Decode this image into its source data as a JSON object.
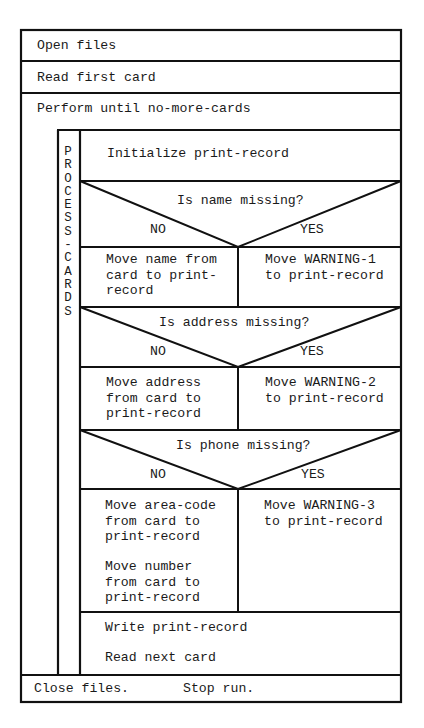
{
  "diagram": {
    "type": "Nassi-Shneiderman structured flowchart",
    "steps": {
      "open": "Open files",
      "read_first": "Read first card",
      "loop": "Perform until no-more-cards",
      "close": "Close files.",
      "stop": "Stop run."
    },
    "procedure": {
      "name_vertical": "P\nR\nO\nC\nE\nS\nS\n-\nC\nA\nR\nD\nS",
      "initialize": "Initialize print-record",
      "decisions": [
        {
          "question": "Is name missing?",
          "no_label": "NO",
          "yes_label": "YES",
          "no_action": "Move name from\ncard to print-\nrecord",
          "yes_action": "Move WARNING-1\nto print-record"
        },
        {
          "question": "Is address missing?",
          "no_label": "NO",
          "yes_label": "YES",
          "no_action": "Move address\nfrom card to\nprint-record",
          "yes_action": "Move WARNING-2\nto print-record"
        },
        {
          "question": "Is phone missing?",
          "no_label": "NO",
          "yes_label": "YES",
          "no_action_1": "Move area-code\nfrom card to\nprint-record",
          "no_action_2": "Move number\nfrom card to\nprint-record",
          "yes_action": "Move WARNING-3\nto print-record"
        }
      ],
      "write": "Write print-record",
      "read_next": "Read next card"
    }
  }
}
